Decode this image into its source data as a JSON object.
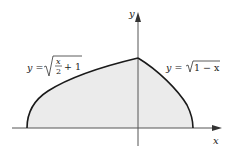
{
  "figure": {
    "axes": {
      "x_label": "x",
      "y_label": "y"
    },
    "curves": [
      {
        "name": "left-curve",
        "label_lhs": "y =",
        "radicand_num": "x",
        "radicand_den": "2",
        "radicand_tail": "+ 1",
        "equation": "y = sqrt(x/2 + 1)",
        "domain": [
          -2,
          0
        ]
      },
      {
        "name": "right-curve",
        "label_lhs": "y =",
        "radicand": "1 − x",
        "equation": "y = sqrt(1 - x)",
        "domain": [
          0,
          1
        ]
      }
    ],
    "region": {
      "description": "shaded region bounded by both curves and the x-axis",
      "fill_color": "#ebebeb"
    },
    "line_color": "#1a1a1a",
    "axis_color": "#555555"
  }
}
